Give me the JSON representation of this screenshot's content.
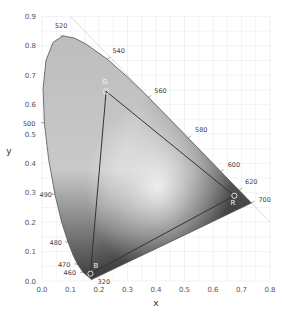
{
  "chart_data": {
    "type": "scatter",
    "title": "",
    "xlabel": "x",
    "ylabel": "y",
    "xlim": [
      0.0,
      0.8
    ],
    "ylim": [
      0.0,
      0.9
    ],
    "grid": true,
    "x_ticks": [
      "0.0",
      "0.1",
      "0.2",
      "0.3",
      "0.4",
      "0.5",
      "0.6",
      "0.7",
      "0.8"
    ],
    "y_ticks": [
      "0.0",
      "0.1",
      "0.2",
      "0.3",
      "0.4",
      "0.5",
      "0.6",
      "0.7",
      "0.8",
      "0.9"
    ],
    "spectral_locus": {
      "name": "CIE 1931 spectral locus",
      "points": [
        [
          0.1741,
          0.005
        ],
        [
          0.144,
          0.0297
        ],
        [
          0.1241,
          0.0578
        ],
        [
          0.1096,
          0.0868
        ],
        [
          0.0913,
          0.1327
        ],
        [
          0.0687,
          0.2007
        ],
        [
          0.0454,
          0.295
        ],
        [
          0.0235,
          0.4127
        ],
        [
          0.0082,
          0.5384
        ],
        [
          0.0039,
          0.6548
        ],
        [
          0.0139,
          0.7502
        ],
        [
          0.0389,
          0.812
        ],
        [
          0.0743,
          0.8338
        ],
        [
          0.1142,
          0.8262
        ],
        [
          0.1547,
          0.8059
        ],
        [
          0.2296,
          0.7543
        ],
        [
          0.3016,
          0.6923
        ],
        [
          0.3731,
          0.6245
        ],
        [
          0.4441,
          0.5547
        ],
        [
          0.5125,
          0.4866
        ],
        [
          0.5752,
          0.4242
        ],
        [
          0.627,
          0.3725
        ],
        [
          0.6915,
          0.3083
        ],
        [
          0.7347,
          0.2653
        ]
      ],
      "wavelength_labels": [
        {
          "nm": "520",
          "x": 0.0743,
          "y": 0.8338
        },
        {
          "nm": "540",
          "x": 0.2296,
          "y": 0.7543
        },
        {
          "nm": "560",
          "x": 0.3731,
          "y": 0.6245
        },
        {
          "nm": "580",
          "x": 0.5125,
          "y": 0.4866
        },
        {
          "nm": "600",
          "x": 0.627,
          "y": 0.3725
        },
        {
          "nm": "620",
          "x": 0.6915,
          "y": 0.3083
        },
        {
          "nm": "700",
          "x": 0.7347,
          "y": 0.2653
        },
        {
          "nm": "500",
          "x": 0.0082,
          "y": 0.5384
        },
        {
          "nm": "490",
          "x": 0.0454,
          "y": 0.295
        },
        {
          "nm": "480",
          "x": 0.0913,
          "y": 0.1327
        },
        {
          "nm": "470",
          "x": 0.1241,
          "y": 0.0578
        },
        {
          "nm": "460",
          "x": 0.144,
          "y": 0.0297
        },
        {
          "nm": "320",
          "x": 0.1741,
          "y": 0.005
        }
      ]
    },
    "gamut_triangle": {
      "points": [
        {
          "label": "R",
          "x": 0.675,
          "y": 0.29
        },
        {
          "label": "G",
          "x": 0.225,
          "y": 0.645
        },
        {
          "label": "B",
          "x": 0.17,
          "y": 0.025
        }
      ]
    },
    "reference_line": {
      "name": "x+y=1",
      "from": [
        0.0,
        1.0
      ],
      "to": [
        0.8,
        0.2
      ]
    }
  },
  "colors": {
    "grid": "#e6e6e6",
    "locus_fill_light": "#d8d8d8",
    "locus_fill_dark": "#3a3a3a",
    "locus_stroke": "#555555",
    "triangle_stroke": "#333333"
  }
}
